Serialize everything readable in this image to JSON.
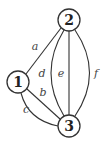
{
  "diagram": {
    "type": "multigraph",
    "nodes": [
      {
        "id": "1",
        "label": "1"
      },
      {
        "id": "2",
        "label": "2"
      },
      {
        "id": "3",
        "label": "3"
      }
    ],
    "edges": [
      {
        "id": "a",
        "label": "a",
        "from": "1",
        "to": "2"
      },
      {
        "id": "b",
        "label": "b",
        "from": "1",
        "to": "3"
      },
      {
        "id": "c",
        "label": "c",
        "from": "1",
        "to": "3"
      },
      {
        "id": "d",
        "label": "d",
        "from": "2",
        "to": "3"
      },
      {
        "id": "e",
        "label": "e",
        "from": "2",
        "to": "3"
      },
      {
        "id": "f",
        "label": "f",
        "from": "2",
        "to": "3"
      }
    ],
    "colors": {
      "stroke": "#333333",
      "node_fill": "#ffffff",
      "text": "#222222",
      "edge_label": "#444444"
    }
  }
}
